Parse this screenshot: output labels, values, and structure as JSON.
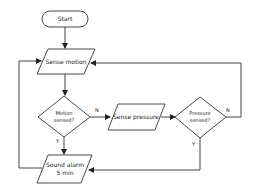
{
  "diagram": {
    "type": "flowchart",
    "nodes": {
      "start": {
        "label": "Start",
        "shape": "terminal"
      },
      "sense_motion": {
        "label": "Sense motion",
        "shape": "parallelogram"
      },
      "motion_sensed": {
        "line1": "Motion",
        "line2": "sensed?",
        "shape": "diamond"
      },
      "sense_pressure": {
        "label": "Sense pressure",
        "shape": "parallelogram"
      },
      "pressure_sensed": {
        "line1": "Pressure",
        "line2": "sensed?",
        "shape": "diamond"
      },
      "sound_alarm": {
        "line1": "Sound alarm",
        "line2": "5 min",
        "shape": "parallelogram"
      }
    },
    "edge_labels": {
      "motion_no": "N",
      "motion_yes": "Y",
      "pressure_no": "N",
      "pressure_yes": "Y"
    },
    "edges": [
      {
        "from": "start",
        "to": "sense_motion"
      },
      {
        "from": "sense_motion",
        "to": "motion_sensed"
      },
      {
        "from": "motion_sensed",
        "to": "sense_pressure",
        "label": "N"
      },
      {
        "from": "motion_sensed",
        "to": "sound_alarm",
        "label": "Y"
      },
      {
        "from": "sense_pressure",
        "to": "pressure_sensed"
      },
      {
        "from": "pressure_sensed",
        "to": "sense_motion",
        "label": "N"
      },
      {
        "from": "pressure_sensed",
        "to": "sound_alarm",
        "label": "Y"
      },
      {
        "from": "sound_alarm",
        "to": "sense_motion"
      }
    ]
  }
}
